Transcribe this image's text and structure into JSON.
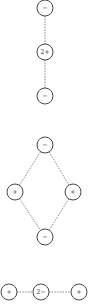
{
  "diagram": {
    "title": "",
    "structures": [
      {
        "name": "linear-anion-cation-anion",
        "nodes": [
          {
            "id": "a1",
            "label": "−",
            "x": 45,
            "y": 8
          },
          {
            "id": "a2",
            "label": "2+",
            "x": 45,
            "y": 52
          },
          {
            "id": "a3",
            "label": "−",
            "x": 45,
            "y": 96
          }
        ],
        "edges": [
          [
            "a1",
            "a2"
          ],
          [
            "a2",
            "a3"
          ]
        ]
      },
      {
        "name": "diamond-arrangement",
        "nodes": [
          {
            "id": "b1",
            "label": "−",
            "x": 45,
            "y": 145
          },
          {
            "id": "b2",
            "label": "+",
            "x": 15,
            "y": 192
          },
          {
            "id": "b3",
            "label": "+",
            "x": 73,
            "y": 192
          },
          {
            "id": "b4",
            "label": "−",
            "x": 45,
            "y": 237
          }
        ],
        "edges": [
          [
            "b1",
            "b2"
          ],
          [
            "b1",
            "b3"
          ],
          [
            "b2",
            "b4"
          ],
          [
            "b3",
            "b4"
          ]
        ]
      },
      {
        "name": "linear-cation-anion-cation",
        "nodes": [
          {
            "id": "c1",
            "label": "+",
            "x": 9,
            "y": 292
          },
          {
            "id": "c2",
            "label": "2−",
            "x": 41,
            "y": 292
          },
          {
            "id": "c3",
            "label": "+",
            "x": 79,
            "y": 292
          }
        ],
        "edges": [
          [
            "c1",
            "c2"
          ],
          [
            "c2",
            "c3"
          ]
        ]
      }
    ],
    "colors": {
      "stroke": "#333333",
      "bond": "#555555",
      "background": "#ffffff"
    },
    "node_radius": 8
  }
}
